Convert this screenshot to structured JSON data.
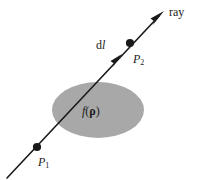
{
  "figure": {
    "background_color": "#ffffff",
    "stroke_color": "#1a1a1a",
    "blob_fill_color": "#a8a8a8",
    "labels": {
      "ray": "ray",
      "dl_d": "d",
      "dl_l": "l",
      "p2_base": "P",
      "p2_sub": "2",
      "p1_base": "P",
      "p1_sub": "1",
      "f_symbol": "f",
      "paren_open": "(",
      "rho": "ρ",
      "paren_close": ")"
    },
    "geometry": {
      "ray_start": [
        7,
        178
      ],
      "ray_tip": [
        164,
        11
      ],
      "arrowhead_tip": [
        164,
        11
      ],
      "dl_arrow_tip": [
        122,
        54
      ],
      "point_p1": [
        37,
        147
      ],
      "point_p2": [
        130,
        43
      ],
      "point_radius": 4,
      "ellipse_center": [
        98,
        110
      ],
      "ellipse_rx": 46,
      "ellipse_ry": 28,
      "ellipse_rotation_deg": 0
    }
  }
}
